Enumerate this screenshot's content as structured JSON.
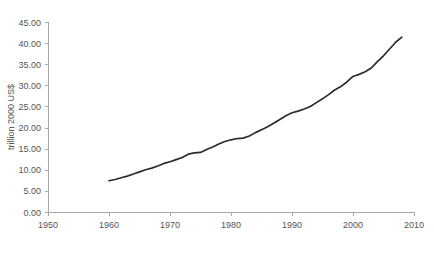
{
  "chart_data": {
    "type": "line",
    "title": "",
    "subtitle": "",
    "xlabel": "",
    "ylabel": "trillion 2000 US$",
    "xlim": [
      1950,
      2010
    ],
    "ylim": [
      0.0,
      45.0
    ],
    "xticks": [
      1950,
      1960,
      1970,
      1980,
      1990,
      2000,
      2010
    ],
    "xtick_labels": [
      "1950",
      "1960",
      "1970",
      "1980",
      "1990",
      "2000",
      "2010"
    ],
    "yticks": [
      0.0,
      5.0,
      10.0,
      15.0,
      20.0,
      25.0,
      30.0,
      35.0,
      40.0,
      45.0
    ],
    "ytick_labels": [
      "0.00",
      "5.00",
      "10.00",
      "15.00",
      "20.00",
      "25.00",
      "30.00",
      "35.00",
      "40.00",
      "45.00"
    ],
    "grid": false,
    "legend": false,
    "legend_position": "none",
    "line_color": "#2b2b2b",
    "axis_color": "#a8a8a8",
    "text_color": "#555555",
    "background_color": "#ffffff",
    "series": [
      {
        "name": "gross world product",
        "x": [
          1960,
          1961,
          1962,
          1963,
          1964,
          1965,
          1966,
          1967,
          1968,
          1969,
          1970,
          1971,
          1972,
          1973,
          1974,
          1975,
          1976,
          1977,
          1978,
          1979,
          1980,
          1981,
          1982,
          1983,
          1984,
          1985,
          1986,
          1987,
          1988,
          1989,
          1990,
          1991,
          1992,
          1993,
          1994,
          1995,
          1996,
          1997,
          1998,
          1999,
          2000,
          2001,
          2002,
          2003,
          2004,
          2005,
          2006,
          2007,
          2008
        ],
        "values": [
          7.4,
          7.7,
          8.1,
          8.5,
          9.0,
          9.5,
          10.0,
          10.4,
          10.9,
          11.5,
          11.9,
          12.4,
          12.9,
          13.7,
          14.0,
          14.1,
          14.8,
          15.4,
          16.1,
          16.7,
          17.1,
          17.4,
          17.5,
          18.0,
          18.8,
          19.5,
          20.2,
          21.0,
          21.9,
          22.8,
          23.5,
          23.9,
          24.4,
          25.0,
          25.9,
          26.8,
          27.8,
          28.9,
          29.7,
          30.8,
          32.1,
          32.6,
          33.2,
          34.1,
          35.6,
          37.0,
          38.6,
          40.2,
          41.4
        ]
      }
    ]
  },
  "axis": {
    "y_title": "trillion 2000 US$"
  }
}
